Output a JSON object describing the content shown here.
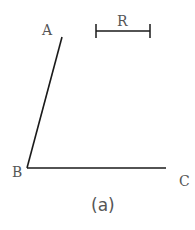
{
  "diagram": {
    "points": {
      "A": {
        "label": "A",
        "x": 62,
        "y": 37
      },
      "B": {
        "label": "B",
        "x": 27,
        "y": 168
      },
      "C": {
        "label": "C",
        "x": 166,
        "y": 168
      }
    },
    "segments": [
      {
        "from": "A",
        "to": "B"
      },
      {
        "from": "B",
        "to": "C"
      }
    ],
    "radius_bar": {
      "label": "R",
      "x1": 96,
      "x2": 150,
      "y": 31
    },
    "caption": "(a)",
    "colors": {
      "line": "#1a1a1a",
      "text": "#555555",
      "background": "#ffffff"
    }
  }
}
